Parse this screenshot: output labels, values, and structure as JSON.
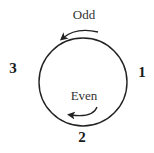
{
  "diagram": {
    "labels": {
      "odd": "Odd",
      "even": "Even"
    },
    "positions": {
      "one": "1",
      "two": "2",
      "three": "3"
    },
    "arrows": [
      {
        "name": "odd-arrow",
        "direction": "counterclockwise",
        "location": "outside-top"
      },
      {
        "name": "even-arrow",
        "direction": "clockwise",
        "location": "inside-bottom"
      }
    ],
    "circle": {
      "cx": 83,
      "cy": 82,
      "r": 44,
      "color": "#222222"
    }
  }
}
